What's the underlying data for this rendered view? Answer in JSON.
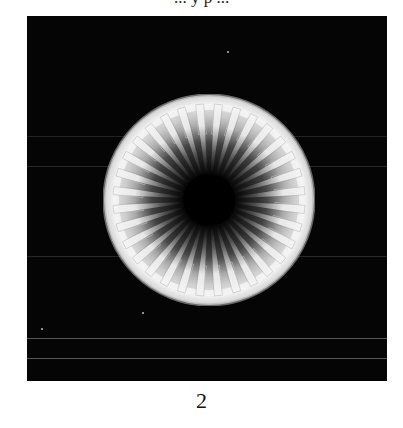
{
  "page": {
    "top_text_fragment": "... y p ...",
    "figure": {
      "subject": "radial-disc-micrograph",
      "background_color": "#050505",
      "disc_color": "#f2f2f2",
      "center_color": "#000000",
      "spoke_count": 32
    },
    "caption": "2"
  }
}
